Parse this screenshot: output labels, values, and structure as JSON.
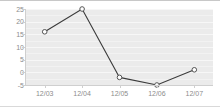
{
  "chart_data": {
    "type": "line",
    "title": "",
    "subtitle": "",
    "xlabel": "",
    "ylabel": "",
    "categories": [
      "12/03",
      "12/04",
      "12/05",
      "12/06",
      "12/07"
    ],
    "values": [
      16,
      25,
      -2,
      -5,
      1
    ],
    "series": [
      {
        "name": "series-1",
        "values": [
          16,
          25,
          -2,
          -5,
          1
        ]
      }
    ],
    "ylim": [
      -5,
      25
    ],
    "xlim": [
      0,
      4
    ],
    "y_ticks": [
      25,
      20,
      15,
      10,
      5,
      0,
      -5
    ],
    "y_tick_labels": [
      "25",
      "20",
      "15",
      "10",
      "5",
      "0",
      "-5"
    ],
    "x_tick_labels": [
      "12/03",
      "12/04",
      "12/05",
      "12/06",
      "12/07"
    ],
    "grid": true,
    "grid_orientation": "horizontal",
    "legend": false,
    "legend_position": "none",
    "marker": "open-circle",
    "annotations": []
  },
  "style": {
    "plot_background": "#ebebeb",
    "gridline_color": "#f7f7f7",
    "line_color": "#3b3b3b",
    "marker_fill": "#ffffff",
    "marker_stroke": "#555555",
    "tick_label_color": "#8c8c8c",
    "axis_color": "#cfcfcf",
    "page_background": "#ffffff"
  }
}
